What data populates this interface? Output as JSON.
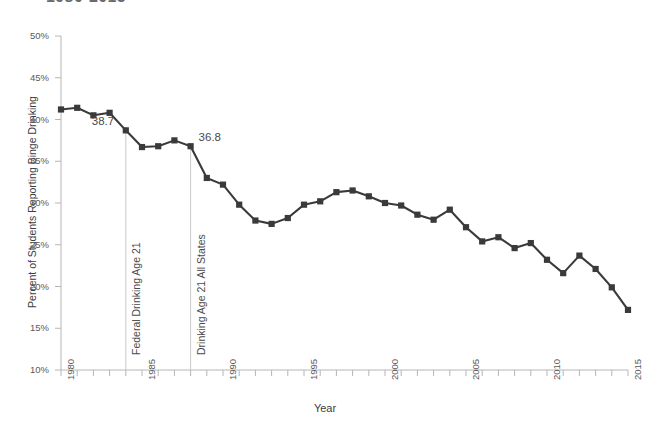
{
  "chart_data": {
    "type": "line",
    "title": "1980-2015",
    "xlabel": "Year",
    "ylabel": "Percent of Students Reporting Binge Drinking",
    "xlim": [
      1980,
      2015
    ],
    "ylim": [
      10,
      50
    ],
    "ytick_labels": [
      "50%",
      "45%",
      "40%",
      "35%",
      "30%",
      "25%",
      "20%",
      "15%",
      "10%"
    ],
    "ytick_values": [
      50,
      45,
      40,
      35,
      30,
      25,
      20,
      15,
      10
    ],
    "xtick_labels": [
      "1980",
      "1985",
      "1990",
      "1995",
      "2000",
      "2005",
      "2010",
      "2015"
    ],
    "xtick_values": [
      1980,
      1985,
      1990,
      1995,
      2000,
      2005,
      2010,
      2015
    ],
    "x": [
      1980,
      1981,
      1982,
      1983,
      1984,
      1985,
      1986,
      1987,
      1988,
      1989,
      1990,
      1991,
      1992,
      1993,
      1994,
      1995,
      1996,
      1997,
      1998,
      1999,
      2000,
      2001,
      2002,
      2003,
      2004,
      2005,
      2006,
      2007,
      2008,
      2009,
      2010,
      2011,
      2012,
      2013,
      2014,
      2015
    ],
    "values": [
      41.2,
      41.4,
      40.5,
      40.8,
      38.7,
      36.7,
      36.8,
      37.5,
      36.8,
      33.0,
      32.2,
      29.8,
      27.9,
      27.5,
      28.2,
      29.8,
      30.2,
      31.3,
      31.5,
      30.8,
      30.0,
      29.7,
      28.6,
      28.0,
      29.2,
      27.1,
      25.4,
      25.9,
      24.6,
      25.2,
      23.2,
      21.6,
      23.7,
      22.1,
      19.9,
      17.2
    ],
    "point_labels": [
      {
        "x": 1984,
        "y": 38.7,
        "text": "38.7",
        "align": "left"
      },
      {
        "x": 1988,
        "y": 36.8,
        "text": "36.8",
        "align": "right"
      }
    ],
    "annotations": [
      {
        "x": 1984,
        "text": "Federal Drinking Age 21"
      },
      {
        "x": 1988,
        "text": "Drinking Age 21 All States"
      }
    ],
    "series_color": "#3a3a3a",
    "marker": "square",
    "grid": false,
    "legend": "none"
  }
}
